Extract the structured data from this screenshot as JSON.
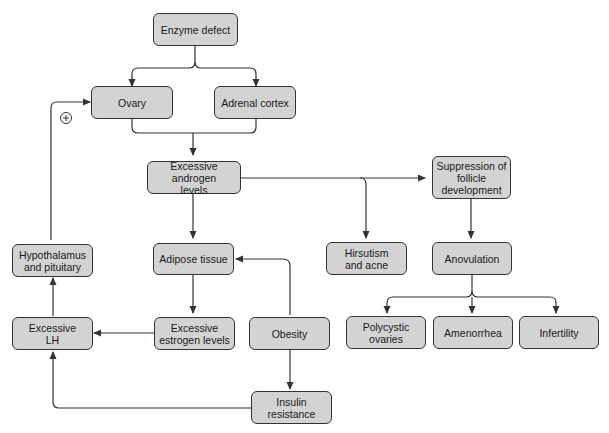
{
  "diagram": {
    "type": "flowchart",
    "node_fill": "#d3d3d3",
    "node_border": "#333333",
    "line_color": "#333333",
    "nodes": {
      "enzyme_defect": "Enzyme defect",
      "ovary": "Ovary",
      "adrenal_cortex": "Adrenal cortex",
      "excessive_androgen": "Excessive androgen\nlevels",
      "suppression_follicle": "Suppression of\nfollicle\ndevelopment",
      "hypothalamus_pituitary": "Hypothalamus\nand pituitary",
      "adipose_tissue": "Adipose tissue",
      "hirsutism_acne": "Hirsutism\nand acne",
      "anovulation": "Anovulation",
      "excessive_lh": "Excessive\nLH",
      "excessive_estrogen": "Excessive\nestrogen levels",
      "obesity": "Obesity",
      "polycystic_ovaries": "Polycystic\novaries",
      "amenorrhea": "Amenorrhea",
      "infertility": "Infertility",
      "insulin_resistance": "Insulin\nresistance"
    },
    "positive_feedback_symbol": "+",
    "edges": [
      [
        "enzyme_defect",
        "ovary"
      ],
      [
        "enzyme_defect",
        "adrenal_cortex"
      ],
      [
        "ovary",
        "excessive_androgen"
      ],
      [
        "adrenal_cortex",
        "excessive_androgen"
      ],
      [
        "excessive_androgen",
        "suppression_follicle"
      ],
      [
        "excessive_androgen",
        "hirsutism_acne"
      ],
      [
        "excessive_androgen",
        "adipose_tissue"
      ],
      [
        "suppression_follicle",
        "anovulation"
      ],
      [
        "anovulation",
        "polycystic_ovaries"
      ],
      [
        "anovulation",
        "amenorrhea"
      ],
      [
        "anovulation",
        "infertility"
      ],
      [
        "adipose_tissue",
        "excessive_estrogen"
      ],
      [
        "excessive_estrogen",
        "excessive_lh"
      ],
      [
        "excessive_lh",
        "hypothalamus_pituitary"
      ],
      [
        "hypothalamus_pituitary",
        "ovary"
      ],
      [
        "obesity",
        "adipose_tissue"
      ],
      [
        "obesity",
        "insulin_resistance"
      ],
      [
        "insulin_resistance",
        "excessive_lh"
      ]
    ]
  }
}
